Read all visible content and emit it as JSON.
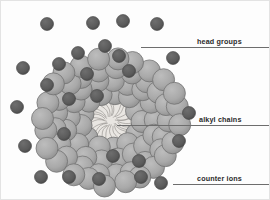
{
  "figure": {
    "background_color": "#fdfdfd",
    "border_color": "#e3e3e3"
  },
  "colors": {
    "head_group_fill": "#a9a9a9",
    "head_group_stroke": "#6b6b6b",
    "counter_ion_fill": "#5b5b5b",
    "counter_ion_stroke": "#3f3f3f",
    "core_fill": "#e9e6e2",
    "alkyl_chain_stroke": "#8d8a86",
    "leader_line": "#6d6d6d",
    "label_text": "#2b2b2b"
  },
  "labels": [
    {
      "id": "head-groups",
      "text": "head groups",
      "text_x": 196,
      "text_y": 37,
      "line_x": 140,
      "line_y": 46,
      "line_w": 128
    },
    {
      "id": "alkyl-chains",
      "text": "alkyl chains",
      "text_x": 198,
      "text_y": 115,
      "line_x": 116,
      "line_y": 124,
      "line_w": 152
    },
    {
      "id": "counter-ions",
      "text": "counter ions",
      "text_x": 196,
      "text_y": 174,
      "line_x": 172,
      "line_y": 183,
      "line_w": 96
    }
  ],
  "core": {
    "cx": 110,
    "cy": 120,
    "rx": 28,
    "ry": 21,
    "chain_count": 26,
    "description": "hydrophobic core of radial alkyl chains"
  },
  "head_groups": {
    "count": 78,
    "radius": 11,
    "description": "hydrophilic head group spheres forming the micelle shell"
  },
  "embedded_counter_ions": {
    "count": 12,
    "radius": 6.5,
    "description": "counter ions bound at the micelle surface"
  },
  "free_counter_ions": {
    "count": 15,
    "radius": 6.5,
    "description": "counter ions free in the surrounding solution",
    "positions": [
      [
        46,
        23
      ],
      [
        92,
        22
      ],
      [
        122,
        20
      ],
      [
        156,
        23
      ],
      [
        22,
        67
      ],
      [
        172,
        57
      ],
      [
        16,
        106
      ],
      [
        188,
        112
      ],
      [
        24,
        145
      ],
      [
        178,
        140
      ],
      [
        40,
        176
      ],
      [
        68,
        176
      ],
      [
        98,
        178
      ],
      [
        140,
        176
      ],
      [
        160,
        182
      ]
    ]
  }
}
